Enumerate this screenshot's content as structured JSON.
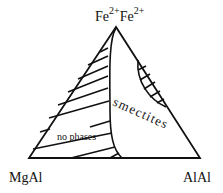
{
  "diagram": {
    "type": "ternary",
    "vertices": {
      "top": {
        "base1": "Fe",
        "sup1": "2+",
        "base2": "Fe",
        "sup2": "2+"
      },
      "bottom_left": "MgAl",
      "bottom_right": "AlAl"
    },
    "regions": [
      {
        "label": "no phases",
        "fill": "hatched"
      },
      {
        "label": "smectites",
        "fill": "none"
      },
      {
        "label": "",
        "fill": "hatched-lens"
      }
    ],
    "colors": {
      "line": "#111111",
      "background": "#ffffff"
    }
  }
}
